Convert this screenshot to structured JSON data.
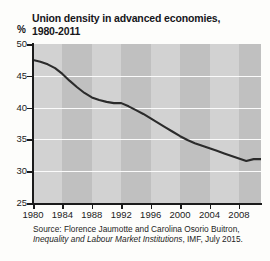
{
  "chart_data": {
    "type": "line",
    "title": "Union density in advanced economies, 1980-2011",
    "title_lines": [
      "Union density in advanced economies,",
      "1980-2011"
    ],
    "xlabel": "",
    "ylabel": "%",
    "ylim": [
      25,
      50
    ],
    "xlim": [
      1980,
      2011
    ],
    "yticks": [
      50,
      45,
      40,
      35,
      30,
      25
    ],
    "ytick_labels": [
      "50",
      "45",
      "40",
      "35",
      "30",
      "25"
    ],
    "xticks": [
      1980,
      1984,
      1988,
      1992,
      1996,
      2000,
      2004,
      2008
    ],
    "xtick_labels": [
      "1980",
      "1984",
      "1988",
      "1992",
      "1996",
      "2000",
      "2004",
      "2008"
    ],
    "grid": "horizontal",
    "legend": "none",
    "series": [
      {
        "name": "Union density",
        "color": "#2b2b2b",
        "x": [
          1980,
          1981,
          1982,
          1983,
          1984,
          1985,
          1986,
          1987,
          1988,
          1989,
          1990,
          1991,
          1992,
          1993,
          1994,
          1995,
          1996,
          1997,
          1998,
          1999,
          2000,
          2001,
          2002,
          2003,
          2004,
          2005,
          2006,
          2007,
          2008,
          2009,
          2010,
          2011
        ],
        "values": [
          47.5,
          47.2,
          46.8,
          46.2,
          45.3,
          44.2,
          43.2,
          42.3,
          41.6,
          41.2,
          40.9,
          40.7,
          40.7,
          40.2,
          39.6,
          39.0,
          38.3,
          37.6,
          36.9,
          36.2,
          35.5,
          34.9,
          34.4,
          34.0,
          33.6,
          33.2,
          32.8,
          32.4,
          32.0,
          31.6,
          31.9,
          31.9
        ]
      }
    ],
    "bands": [
      {
        "from": 1984,
        "to": 1988
      },
      {
        "from": 1992,
        "to": 1996
      },
      {
        "from": 2000,
        "to": 2004
      },
      {
        "from": 2008,
        "to": 2011
      }
    ]
  },
  "source": {
    "line1": "Source: Florence Jaumotte and Carolina Osorio Buitron,",
    "line2_italic": "Inequality and Labour Market Institutions",
    "line2_rest": ", IMF, July 2015."
  }
}
